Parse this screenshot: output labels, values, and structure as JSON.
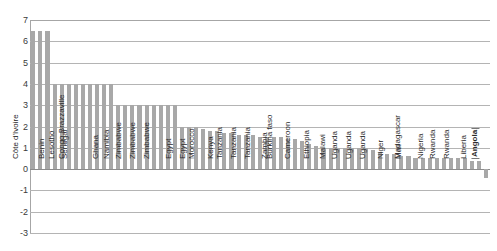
{
  "chart_data": {
    "type": "bar",
    "title": "",
    "subtitle": "",
    "xlabel": "",
    "ylabel": "",
    "ylim": [
      -3,
      7
    ],
    "yticks": [
      7,
      6,
      5,
      4,
      3,
      2,
      1,
      0,
      -1,
      -2,
      -3
    ],
    "grid": true,
    "legend": null,
    "bar_color": "#a8a8a8",
    "axis_color": "#a6a6a6",
    "grid_color": "#b4b4b4",
    "categories": [
      "Côte d'Ivoire",
      "",
      "Benin",
      "",
      "Lesotho",
      "",
      "Senegal",
      "",
      "Congo Brazzaville",
      "",
      "Ghana",
      "",
      "Namibia",
      "",
      "Zimbabwe",
      "",
      "Zimbabwe",
      "",
      "Zimbabwe",
      "",
      "Egypt",
      "",
      "Egypt",
      "",
      "Morocco",
      "",
      "Kenya",
      "",
      "Tanzania",
      "",
      "Tanzania",
      "",
      "Tanzania",
      "",
      "Zambia",
      "",
      "Burkina faso",
      "",
      "Cameroon",
      "",
      "Ethiopia",
      "",
      "Malawi",
      "",
      "Uganda",
      "",
      "Uganda",
      "",
      "Uganda",
      "",
      "Niger",
      "",
      "Mali",
      "",
      "Madagascar",
      "",
      "Nigeria",
      "",
      "Rwanda",
      "",
      "Rwanda",
      "",
      "Liberia",
      "",
      "Angola"
    ],
    "values": [
      6.5,
      6.5,
      6.5,
      4.0,
      4.0,
      4.0,
      4.0,
      4.0,
      4.0,
      4.0,
      4.0,
      4.0,
      3.0,
      3.0,
      3.0,
      3.0,
      3.0,
      3.0,
      3.0,
      3.0,
      3.0,
      2.0,
      2.0,
      2.0,
      1.9,
      1.8,
      1.8,
      1.7,
      1.7,
      1.6,
      1.6,
      1.6,
      1.5,
      1.5,
      1.5,
      1.5,
      1.4,
      1.4,
      1.3,
      1.2,
      1.1,
      1.0,
      1.0,
      1.0,
      1.0,
      1.0,
      1.0,
      1.0,
      0.9,
      0.8,
      0.7,
      0.7,
      0.6,
      0.6,
      0.5,
      0.5,
      0.5,
      0.5,
      0.5,
      0.5,
      0.5,
      0.5,
      0.4,
      0.4,
      -0.4
    ],
    "emphasized_category": "Angola"
  }
}
